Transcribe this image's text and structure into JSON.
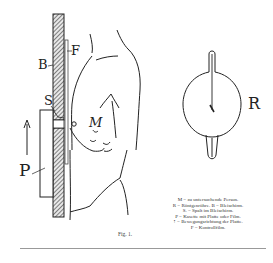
{
  "figure": {
    "caption": "Fig. 1.",
    "labels": {
      "B": "B",
      "F": "F",
      "S": "S",
      "P": "P",
      "M": "M",
      "R": "R"
    },
    "legend": [
      "M = zu untersuchende Person.",
      "R = Röntgenröhre.   B = Bleischirm.",
      "S. = Spalt im Bleischirm.",
      "P = Kasette mit Platte oder Film.",
      "↑ = Bewegungsrichtung der Platte.",
      "F = Kontrollfilm."
    ]
  }
}
